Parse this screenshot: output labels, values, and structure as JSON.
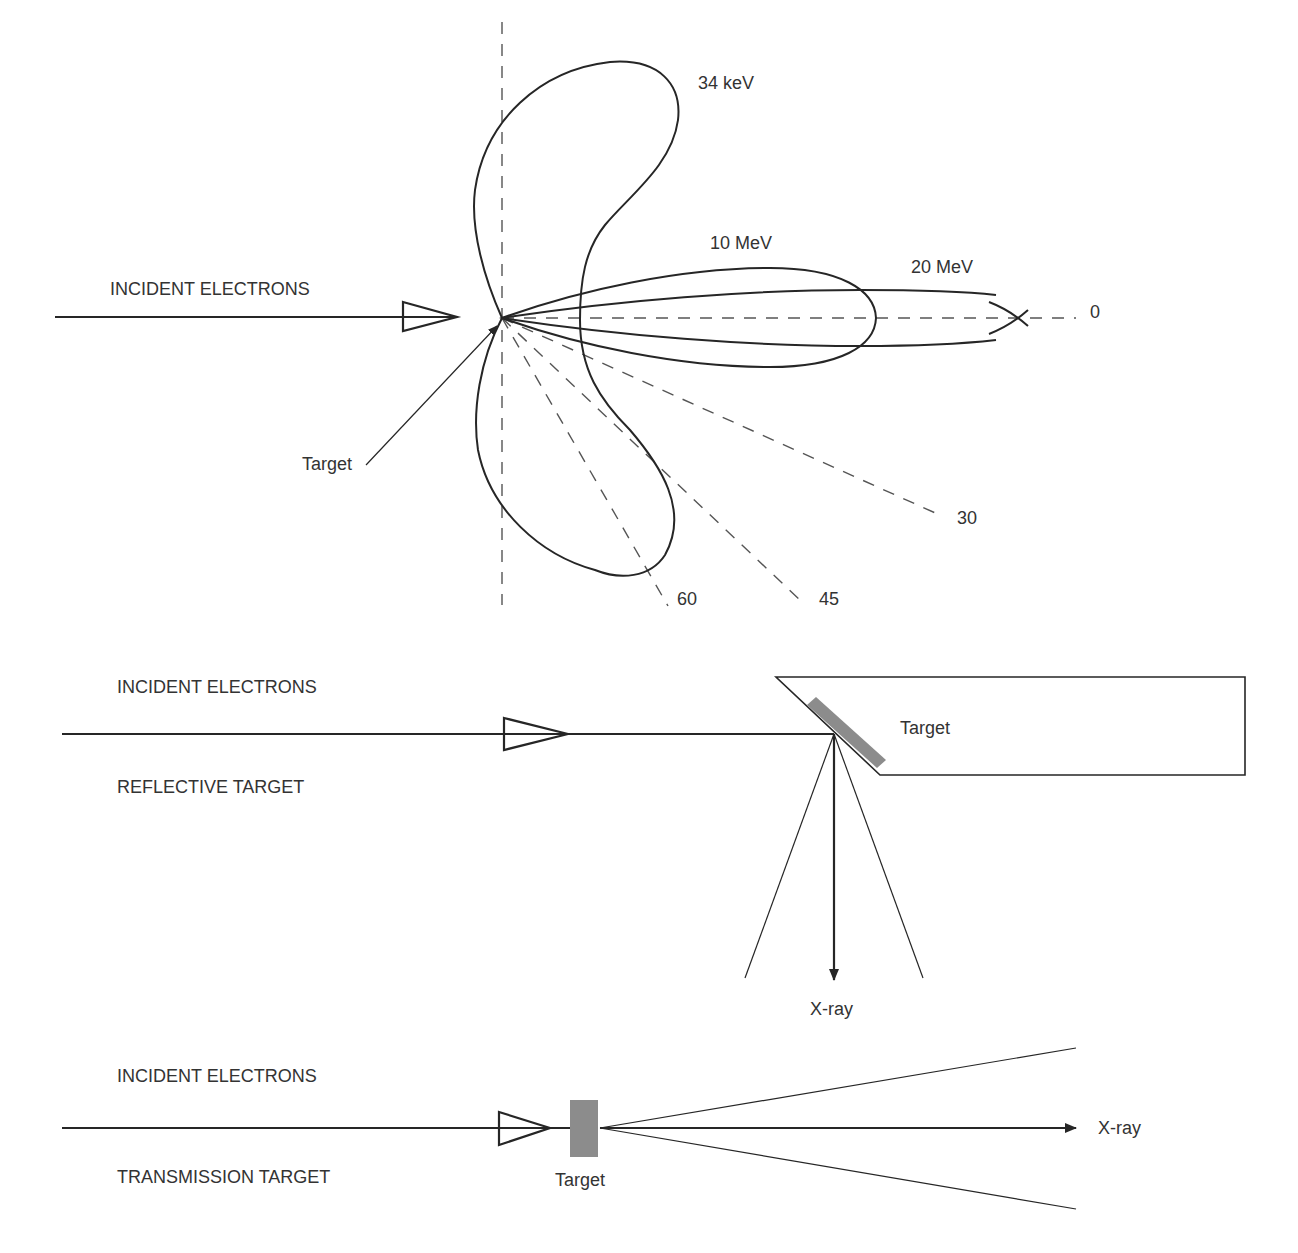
{
  "colors": {
    "line": "#262626",
    "dashed": "#555555",
    "target_fill": "#8c8c8c",
    "text": "#333333",
    "background": "#ffffff"
  },
  "panel_polar": {
    "incident_label": "INCIDENT ELECTRONS",
    "target_label": "Target",
    "lobes": [
      {
        "name": "34 keV",
        "label": "34 keV"
      },
      {
        "name": "10 MeV",
        "label": "10 MeV"
      },
      {
        "name": "20 MeV",
        "label": "20 MeV"
      }
    ],
    "angles": [
      {
        "deg": 0,
        "label": "0"
      },
      {
        "deg": 30,
        "label": "30"
      },
      {
        "deg": 45,
        "label": "45"
      },
      {
        "deg": 60,
        "label": "60"
      }
    ]
  },
  "panel_reflective": {
    "incident_label": "INCIDENT ELECTRONS",
    "mode_label": "REFLECTIVE TARGET",
    "target_label": "Target",
    "xray_label": "X-ray"
  },
  "panel_transmission": {
    "incident_label": "INCIDENT ELECTRONS",
    "mode_label": "TRANSMISSION TARGET",
    "target_label": "Target",
    "xray_label": "X-ray"
  }
}
